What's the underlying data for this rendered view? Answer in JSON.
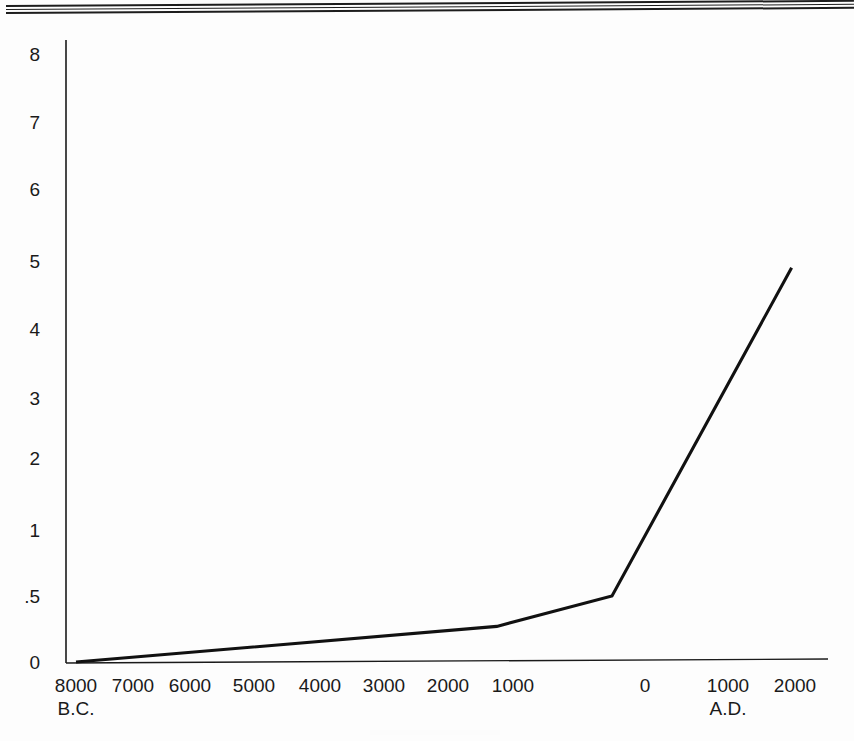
{
  "page": {
    "background_color": "#fdfdfd",
    "ink_color": "#1a1a1a",
    "top_rule": {
      "name": "double-horizontal-rule",
      "lines": 3
    }
  },
  "chart_data": {
    "type": "line",
    "title": "",
    "subtitle": "",
    "xlabel": "",
    "ylabel": "",
    "grid": false,
    "legend": "none",
    "series_name": "World population (billions)",
    "x_axis": {
      "tick_labels": [
        "8000",
        "7000",
        "6000",
        "5000",
        "4000",
        "3000",
        "2000",
        "1000",
        "0",
        "1000",
        "2000"
      ],
      "era_labels": [
        {
          "text": "B.C.",
          "under_tick": "8000"
        },
        {
          "text": "A.D.",
          "under_tick": "1000"
        }
      ],
      "year_values": [
        -8000,
        -7000,
        -6000,
        -5000,
        -4000,
        -3000,
        -2000,
        -1000,
        0,
        1000,
        2000
      ],
      "range": [
        -8000,
        2000
      ]
    },
    "y_axis": {
      "tick_labels": [
        "8",
        "7",
        "6",
        "5",
        "4",
        "3",
        "2",
        "1",
        ".5",
        "0"
      ],
      "tick_values": [
        8,
        7,
        6,
        5,
        4,
        3,
        2,
        1,
        0.5,
        0
      ],
      "scale": "nonlinear-compressed-below-1",
      "unit": "billions",
      "range": [
        0,
        8
      ]
    },
    "x": [
      -8000,
      -1250,
      -250,
      1950
    ],
    "values": [
      0.0,
      0.27,
      0.5,
      4.9
    ],
    "points": [
      {
        "year": "8000 B.C.",
        "population": 0.0
      },
      {
        "year": "1250 B.C.",
        "population": 0.27
      },
      {
        "year": "250 A.D.",
        "population": 0.5
      },
      {
        "year": "1950 A.D.",
        "population": 4.9
      }
    ],
    "annotations": []
  },
  "axis_labels": {
    "y": [
      {
        "text": "8",
        "top": 45
      },
      {
        "text": "7",
        "top": 113
      },
      {
        "text": "6",
        "top": 180
      },
      {
        "text": "5",
        "top": 252
      },
      {
        "text": "4",
        "top": 320
      },
      {
        "text": "3",
        "top": 389
      },
      {
        "text": "2",
        "top": 449
      },
      {
        "text": "1",
        "top": 521
      },
      {
        "text": ".5",
        "top": 587
      },
      {
        "text": "0",
        "top": 653
      }
    ],
    "x": [
      {
        "text": "8000",
        "left": 36
      },
      {
        "text": "7000",
        "left": 93
      },
      {
        "text": "6000",
        "left": 150
      },
      {
        "text": "5000",
        "left": 214
      },
      {
        "text": "4000",
        "left": 280
      },
      {
        "text": "3000",
        "left": 344
      },
      {
        "text": "2000",
        "left": 408
      },
      {
        "text": "1000",
        "left": 473
      },
      {
        "text": "0",
        "left": 605
      },
      {
        "text": "1000",
        "left": 688
      },
      {
        "text": "2000",
        "left": 755
      }
    ],
    "era": [
      {
        "text": "B.C.",
        "left": 36,
        "top": 699
      },
      {
        "text": "A.D.",
        "left": 688,
        "top": 699
      }
    ]
  }
}
